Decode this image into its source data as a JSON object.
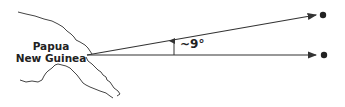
{
  "diagram": {
    "region_label_line1": "Papua",
    "region_label_line2": "New Guinea",
    "angle_label": "~9°",
    "colors": {
      "line": "#333333",
      "coast": "#444444",
      "dot": "#222222",
      "background": "#ffffff"
    },
    "arrows": [
      {
        "name": "upper-arrow",
        "from": [
          87,
          55
        ],
        "to": [
          316,
          15
        ]
      },
      {
        "name": "lower-arrow",
        "from": [
          87,
          55
        ],
        "to": [
          316,
          55
        ]
      }
    ],
    "targets": [
      {
        "name": "upper-target-dot",
        "at": [
          323,
          15
        ]
      },
      {
        "name": "lower-target-dot",
        "at": [
          324,
          55
        ]
      }
    ]
  }
}
